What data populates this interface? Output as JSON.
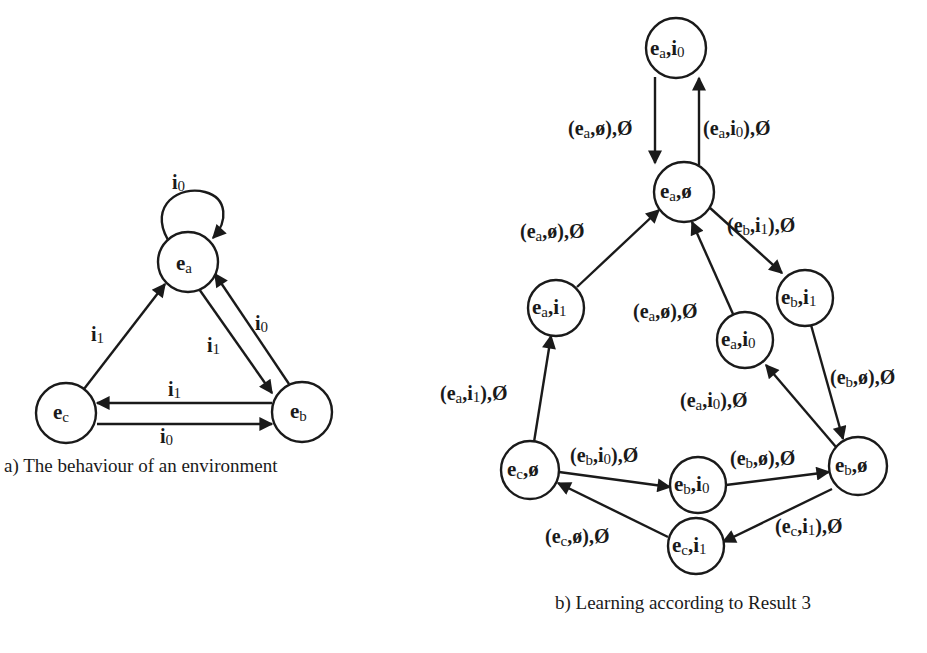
{
  "diagram_a": {
    "caption": "a) The behaviour of an environment",
    "nodes": [
      {
        "id": "ea",
        "base": "e",
        "sub": "a",
        "x": 188,
        "y": 262
      },
      {
        "id": "eb",
        "base": "e",
        "sub": "b",
        "x": 302,
        "y": 412
      },
      {
        "id": "ec",
        "base": "e",
        "sub": "c",
        "x": 66,
        "y": 413
      }
    ],
    "edges": [
      {
        "from": "ea",
        "to": "ea",
        "label": {
          "base": "i",
          "sub": "0"
        }
      },
      {
        "from": "ec",
        "to": "ea",
        "label": {
          "base": "i",
          "sub": "1"
        }
      },
      {
        "from": "ea",
        "to": "eb",
        "label": {
          "base": "i",
          "sub": "1"
        }
      },
      {
        "from": "eb",
        "to": "ea",
        "label": {
          "base": "i",
          "sub": "0"
        }
      },
      {
        "from": "eb",
        "to": "ec",
        "label": {
          "base": "i",
          "sub": "1"
        }
      },
      {
        "from": "ec",
        "to": "eb",
        "label": {
          "base": "i",
          "sub": "0"
        }
      }
    ]
  },
  "diagram_b": {
    "caption": "b) Learning according to Result 3",
    "nodes": [
      {
        "id": "ea_i0_top",
        "text": "ea,i0",
        "x": 676,
        "y": 48
      },
      {
        "id": "ea_empty",
        "text": "ea,ø",
        "x": 684,
        "y": 192
      },
      {
        "id": "ea_i1",
        "text": "ea,i1",
        "x": 556,
        "y": 308
      },
      {
        "id": "eb_i1",
        "text": "eb,i1",
        "x": 805,
        "y": 298
      },
      {
        "id": "ea_i0_mid",
        "text": "ea,i0",
        "x": 745,
        "y": 340
      },
      {
        "id": "ec_empty",
        "text": "ec,ø",
        "x": 530,
        "y": 470
      },
      {
        "id": "eb_i0",
        "text": "eb,i0",
        "x": 698,
        "y": 485
      },
      {
        "id": "eb_empty",
        "text": "eb,ø",
        "x": 858,
        "y": 466
      },
      {
        "id": "ec_i1",
        "text": "ec,i1",
        "x": 696,
        "y": 546
      }
    ],
    "edges": [
      {
        "from": "ea_i0_top",
        "to": "ea_empty",
        "label": "(ea,ø),Ø"
      },
      {
        "from": "ea_empty",
        "to": "ea_i0_top",
        "label": "(ea,i0),Ø"
      },
      {
        "from": "ea_i1",
        "to": "ea_empty",
        "label": "(ea,ø),Ø"
      },
      {
        "from": "ea_empty",
        "to": "eb_i1",
        "label": "(eb,i1),Ø"
      },
      {
        "from": "ea_i0_mid",
        "to": "ea_empty",
        "label": "(ea,ø),Ø"
      },
      {
        "from": "eb_i1",
        "to": "eb_empty",
        "label": "(eb,ø),Ø"
      },
      {
        "from": "eb_empty",
        "to": "ea_i0_mid",
        "label": "(ea,i0),Ø"
      },
      {
        "from": "ec_empty",
        "to": "ea_i1",
        "label": "(ea,i1),Ø"
      },
      {
        "from": "ec_empty",
        "to": "eb_i0",
        "label": "(eb,i0),Ø"
      },
      {
        "from": "eb_i0",
        "to": "eb_empty",
        "label": "(eb,ø),Ø"
      },
      {
        "from": "eb_empty",
        "to": "ec_i1",
        "label": "(ec,i1),Ø"
      },
      {
        "from": "ec_i1",
        "to": "ec_empty",
        "label": "(ec,ø),Ø"
      }
    ]
  }
}
